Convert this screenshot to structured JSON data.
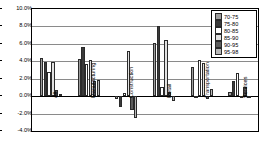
{
  "chart_data": {
    "type": "bar",
    "title": "",
    "xlabel": "",
    "ylabel": "",
    "ylim": [
      -4.0,
      10.0
    ],
    "ytick_step": 2.0,
    "ytick_labels": [
      "10.0%",
      "8.0%",
      "6.0%",
      "4.0%",
      "2.0%",
      "0.0%",
      "-2.0%",
      "-4.0%"
    ],
    "ytick_values": [
      10.0,
      8.0,
      6.0,
      4.0,
      2.0,
      0.0,
      -2.0,
      -4.0
    ],
    "grid": true,
    "legend_position": "top-right",
    "value_unit": "%",
    "categories": [
      "All",
      "Manufacturing",
      "Construction",
      "Retail",
      "Transportation",
      "Services"
    ],
    "series": [
      {
        "name": "70-75",
        "color": "#9d9d9d",
        "values": [
          4.4,
          4.3,
          -0.3,
          6.1,
          3.4,
          0.5
        ]
      },
      {
        "name": "75-80",
        "color": "#3a3a3a",
        "values": [
          3.9,
          5.6,
          -1.3,
          8.1,
          -0.1,
          1.7
        ]
      },
      {
        "name": "80-85",
        "color": "#ffffff",
        "values": [
          2.8,
          3.7,
          0.4,
          1.1,
          4.1,
          2.6
        ]
      },
      {
        "name": "85-90",
        "color": "#e2e2e2",
        "values": [
          3.9,
          4.1,
          5.2,
          6.4,
          3.75,
          -0.2
        ]
      },
      {
        "name": "90-95",
        "color": "#5c5c5c",
        "values": [
          0.7,
          1.75,
          -1.6,
          0.5,
          -0.3,
          1.1
        ]
      },
      {
        "name": "95-98",
        "color": "#b8b8b8",
        "values": [
          0.3,
          1.9,
          -2.5,
          -0.6,
          0.8,
          -0.1
        ]
      }
    ]
  },
  "legend": {
    "items": [
      "70-75",
      "75-80",
      "80-85",
      "85-90",
      "90-95",
      "95-98"
    ]
  }
}
